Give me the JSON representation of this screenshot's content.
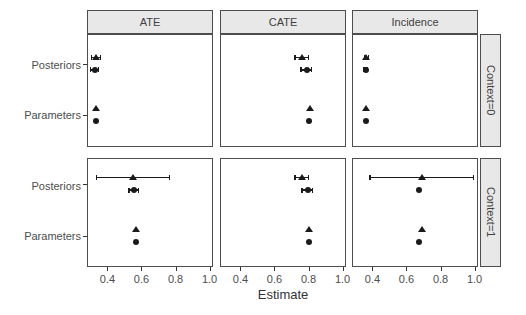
{
  "chart_data": {
    "type": "scatter",
    "title": "",
    "xlabel": "Estimate",
    "xlim": [
      0.28,
      1.02
    ],
    "x_ticks": [
      0.4,
      0.6,
      0.8,
      1.0
    ],
    "x_tick_labels": [
      "0.4",
      "0.6",
      "0.8",
      "1.0"
    ],
    "y_categories": [
      "Posteriors",
      "Parameters"
    ],
    "facet_columns": [
      "ATE",
      "CATE",
      "Incidence"
    ],
    "facet_rows": [
      "Context=0",
      "Context=1"
    ],
    "markers": [
      "triangle",
      "circle"
    ],
    "grid": false,
    "legend": "none",
    "colors": {
      "point": "#1a1a1a",
      "panel_border": "#4d4d4d",
      "strip_fill": "#e8e8e8",
      "axis_text": "#4d4d4d"
    },
    "panels": [
      {
        "facet_col": "ATE",
        "facet_row": "Context=0",
        "points": [
          {
            "category": "Posteriors",
            "marker": "triangle",
            "x": 0.33,
            "xmin": 0.305,
            "xmax": 0.36
          },
          {
            "category": "Posteriors",
            "marker": "circle",
            "x": 0.325,
            "xmin": 0.3,
            "xmax": 0.35
          },
          {
            "category": "Parameters",
            "marker": "triangle",
            "x": 0.335
          },
          {
            "category": "Parameters",
            "marker": "circle",
            "x": 0.33
          }
        ]
      },
      {
        "facet_col": "CATE",
        "facet_row": "Context=0",
        "points": [
          {
            "category": "Posteriors",
            "marker": "triangle",
            "x": 0.76,
            "xmin": 0.72,
            "xmax": 0.8
          },
          {
            "category": "Posteriors",
            "marker": "circle",
            "x": 0.79,
            "xmin": 0.755,
            "xmax": 0.82
          },
          {
            "category": "Parameters",
            "marker": "triangle",
            "x": 0.81
          },
          {
            "category": "Parameters",
            "marker": "circle",
            "x": 0.805
          }
        ]
      },
      {
        "facet_col": "Incidence",
        "facet_row": "Context=0",
        "points": [
          {
            "category": "Posteriors",
            "marker": "triangle",
            "x": 0.365,
            "xmin": 0.353,
            "xmax": 0.377
          },
          {
            "category": "Posteriors",
            "marker": "circle",
            "x": 0.36,
            "xmin": 0.35,
            "xmax": 0.37
          },
          {
            "category": "Parameters",
            "marker": "triangle",
            "x": 0.365
          },
          {
            "category": "Parameters",
            "marker": "circle",
            "x": 0.36
          }
        ]
      },
      {
        "facet_col": "ATE",
        "facet_row": "Context=1",
        "points": [
          {
            "category": "Posteriors",
            "marker": "triangle",
            "x": 0.55,
            "xmin": 0.335,
            "xmax": 0.765
          },
          {
            "category": "Posteriors",
            "marker": "circle",
            "x": 0.555,
            "xmin": 0.525,
            "xmax": 0.585
          },
          {
            "category": "Parameters",
            "marker": "triangle",
            "x": 0.57
          },
          {
            "category": "Parameters",
            "marker": "circle",
            "x": 0.565
          }
        ]
      },
      {
        "facet_col": "CATE",
        "facet_row": "Context=1",
        "points": [
          {
            "category": "Posteriors",
            "marker": "triangle",
            "x": 0.76,
            "xmin": 0.72,
            "xmax": 0.8
          },
          {
            "category": "Posteriors",
            "marker": "circle",
            "x": 0.795,
            "xmin": 0.76,
            "xmax": 0.825
          },
          {
            "category": "Parameters",
            "marker": "triangle",
            "x": 0.805
          },
          {
            "category": "Parameters",
            "marker": "circle",
            "x": 0.8
          }
        ]
      },
      {
        "facet_col": "Incidence",
        "facet_row": "Context=1",
        "points": [
          {
            "category": "Posteriors",
            "marker": "triangle",
            "x": 0.69,
            "xmin": 0.385,
            "xmax": 0.995
          },
          {
            "category": "Posteriors",
            "marker": "circle",
            "x": 0.675
          },
          {
            "category": "Parameters",
            "marker": "triangle",
            "x": 0.69
          },
          {
            "category": "Parameters",
            "marker": "circle",
            "x": 0.675
          }
        ]
      }
    ]
  }
}
